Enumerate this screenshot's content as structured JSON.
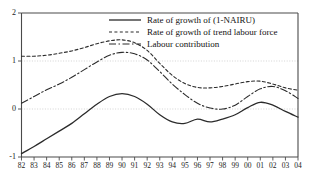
{
  "chart_data": {
    "type": "line",
    "title": "",
    "xlabel": "",
    "ylabel": "",
    "xlim": [
      1982,
      2004
    ],
    "ylim": [
      -1,
      2
    ],
    "yticks": [
      -1,
      0,
      1,
      2
    ],
    "ytick_labels": [
      "-1",
      "0",
      "1",
      "2"
    ],
    "grid": "horizontal-dotted-at-0-and-1",
    "legend_position": "top-center-right",
    "x": [
      1982,
      1983,
      1984,
      1985,
      1986,
      1987,
      1988,
      1989,
      1990,
      1991,
      1992,
      1993,
      1994,
      1995,
      1996,
      1997,
      1998,
      1999,
      2000,
      2001,
      2002,
      2003,
      2004
    ],
    "xtick_labels": [
      "82",
      "83",
      "84",
      "85",
      "86",
      "87",
      "88",
      "89",
      "90",
      "91",
      "92",
      "93",
      "94",
      "95",
      "96",
      "97",
      "98",
      "99",
      "00",
      "01",
      "02",
      "03",
      "04"
    ],
    "series": [
      {
        "name": "Rate of growth of (1-NAIRU)",
        "style": "solid",
        "color": "#2b2b2b",
        "values": [
          -0.93,
          -0.78,
          -0.62,
          -0.46,
          -0.3,
          -0.1,
          0.1,
          0.26,
          0.32,
          0.26,
          0.1,
          -0.12,
          -0.27,
          -0.3,
          -0.21,
          -0.27,
          -0.21,
          -0.12,
          0.03,
          0.14,
          0.08,
          -0.05,
          -0.17
        ]
      },
      {
        "name": "Rate of growth of trend labour force",
        "style": "dotted",
        "color": "#2b2b2b",
        "values": [
          1.1,
          1.1,
          1.12,
          1.16,
          1.21,
          1.28,
          1.36,
          1.42,
          1.44,
          1.38,
          1.22,
          0.95,
          0.7,
          0.53,
          0.45,
          0.44,
          0.47,
          0.52,
          0.57,
          0.58,
          0.52,
          0.44,
          0.39
        ]
      },
      {
        "name": "Labour contribution",
        "style": "dash-dot",
        "color": "#2b2b2b",
        "values": [
          0.12,
          0.26,
          0.4,
          0.52,
          0.66,
          0.82,
          0.98,
          1.12,
          1.18,
          1.15,
          1.02,
          0.78,
          0.52,
          0.3,
          0.12,
          0.02,
          0.0,
          0.08,
          0.26,
          0.42,
          0.47,
          0.38,
          0.22
        ]
      }
    ]
  },
  "legend": {
    "entries": [
      {
        "label": "Rate of growth of (1-NAIRU)",
        "style": "solid"
      },
      {
        "label": "Rate of growth of trend labour force",
        "style": "dotted"
      },
      {
        "label": "Labour contribution",
        "style": "dash-dot"
      }
    ]
  },
  "axes": {
    "y_tick_labels": [
      "2",
      "1",
      "0",
      "-1"
    ],
    "x_tick_labels": [
      "82",
      "83",
      "84",
      "85",
      "86",
      "87",
      "88",
      "89",
      "90",
      "91",
      "92",
      "93",
      "94",
      "95",
      "96",
      "97",
      "98",
      "99",
      "00",
      "01",
      "02",
      "03",
      "04"
    ]
  },
  "colors": {
    "line": "#2b2b2b",
    "axis": "#4a4a4a",
    "grid": "#c8c8c8",
    "background": "#ffffff"
  }
}
